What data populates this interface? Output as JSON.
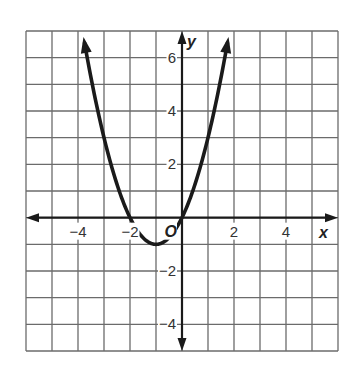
{
  "chart_data": {
    "type": "line",
    "title": "",
    "xlabel": "x",
    "ylabel": "y",
    "function": "y = x^2 + 2x",
    "xlim": [
      -6,
      6
    ],
    "ylim": [
      -5,
      7
    ],
    "grid": true,
    "grid_step": 1,
    "x_ticks": [
      -4,
      -2,
      2,
      4
    ],
    "x_tick_labels": [
      "−4",
      "−2",
      "2",
      "4"
    ],
    "y_ticks": [
      -4,
      -2,
      2,
      4,
      6
    ],
    "y_tick_labels": [
      "−4",
      "−2",
      "2",
      "4",
      "6"
    ],
    "origin_label": "O",
    "series": [
      {
        "name": "parabola",
        "x": [
          -3.83,
          -3,
          -2,
          -1,
          0,
          1,
          1.83
        ],
        "y": [
          7,
          3,
          0,
          -1,
          0,
          3,
          7
        ]
      }
    ],
    "key_points": {
      "vertex": [
        -1,
        -1
      ],
      "x_intercepts": [
        -2,
        0
      ],
      "y_intercept": 0
    },
    "colors": {
      "grid": "#6b6b6b",
      "axes": "#1a1a1a",
      "curve": "#1a1a1a"
    }
  }
}
